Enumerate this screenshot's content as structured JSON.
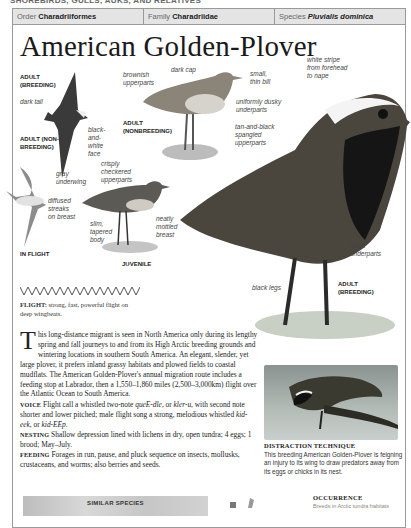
{
  "running_head": "SHOREBIRDS, GULLS, AUKS, AND RELATIVES",
  "taxonomy": {
    "order_label": "Order",
    "order_value": "Charadriiformes",
    "family_label": "Family",
    "family_value": "Charadriidae",
    "species_label": "Species",
    "species_value": "Pluvialis dominica"
  },
  "title": "American Golden-Plover",
  "illustration_labels": {
    "adult_breeding_flight": [
      "ADULT",
      "(BREEDING)"
    ],
    "dark_tail": "dark tail",
    "black_white_face": [
      "black-",
      "and-",
      "white",
      "face"
    ],
    "adult_nonbreeding_flight": [
      "ADULT (NON-",
      "BREEDING)"
    ],
    "gray_underwing": [
      "gray",
      "underwing"
    ],
    "diffused_streaks": [
      "diffused",
      "streaks",
      "on breast"
    ],
    "in_flight": "IN FLIGHT",
    "brownish_upperparts": [
      "brownish",
      "upperparts"
    ],
    "dark_cap": "dark cap",
    "small_thin_bill": [
      "small,",
      "thin bill"
    ],
    "uniformly_dusky": [
      "uniformly dusky",
      "underparts"
    ],
    "adult_nonbreeding": [
      "ADULT",
      "(NONBREEDING)"
    ],
    "tan_black_spangled": [
      "tan-and-black",
      "spangled",
      "upperparts"
    ],
    "crisply_checkered": [
      "crisply",
      "checkered",
      "upperparts"
    ],
    "slim_tapered": [
      "slim,",
      "tapered",
      "body"
    ],
    "neatly_mottled": [
      "neatly",
      "mottled",
      "breast"
    ],
    "juvenile": "JUVENILE",
    "white_stripe": [
      "white stripe",
      "from forehead",
      "to nape"
    ],
    "black_underparts": [
      "black",
      "underparts"
    ],
    "black_legs": "black legs",
    "adult_breeding": [
      "ADULT",
      "(BREEDING)"
    ]
  },
  "flight": {
    "heading": "FLIGHT:",
    "text": " strong, fast, powerful flight on deep wingbeats."
  },
  "description": {
    "dropcap": "T",
    "intro": "his long-distance migrant is seen in North America only during its lengthy spring and fall journeys to and from its High Arctic breeding grounds and wintering locations in southern South America. An elegant, slender, yet large plover, it prefers inland grassy habitats and plowed fields to coastal mudflats. The American Golden-Plover's annual migration route includes a feeding stop at Labrador, then a 1,550–1,860 miles (2,500–3,000km) flight over the Atlantic Ocean to South America.",
    "voice_heading": "VOICE",
    "voice_a": " Flight call a whistled two-note ",
    "voice_i1": "queE-dle",
    "voice_b": ", or ",
    "voice_i2": "kler-u",
    "voice_c": ", with second note shorter and lower pitched; male flight song a strong, melodious whistled ",
    "voice_i3": "kid-eek",
    "voice_d": ", or ",
    "voice_i4": "kid-EEp",
    "voice_e": ".",
    "nesting_heading": "NESTING",
    "nesting": " Shallow depression lined with lichens in dry, open tundra; 4 eggs; 1 brood; May–July.",
    "feeding_heading": "FEEDING",
    "feeding": " Forages in run, pause, and pluck sequence on insects, mollusks, crustaceans, and worms; also berries and seeds."
  },
  "photo": {
    "caption_heading": "DISTRACTION TECHNIQUE",
    "caption": "This breeding American Golden-Plover is feigning an injury to its wing to draw predators away from its eggs or chicks in its nest."
  },
  "similar_species": {
    "heading": "SIMILAR SPECIES"
  },
  "occurrence": {
    "heading": "OCCURRENCE",
    "text": "Breeds in Arctic tundra habitats"
  },
  "colors": {
    "tax_bar_bg": "#e4e4e4",
    "frame_border": "#9a9a9a",
    "text": "#222222"
  }
}
